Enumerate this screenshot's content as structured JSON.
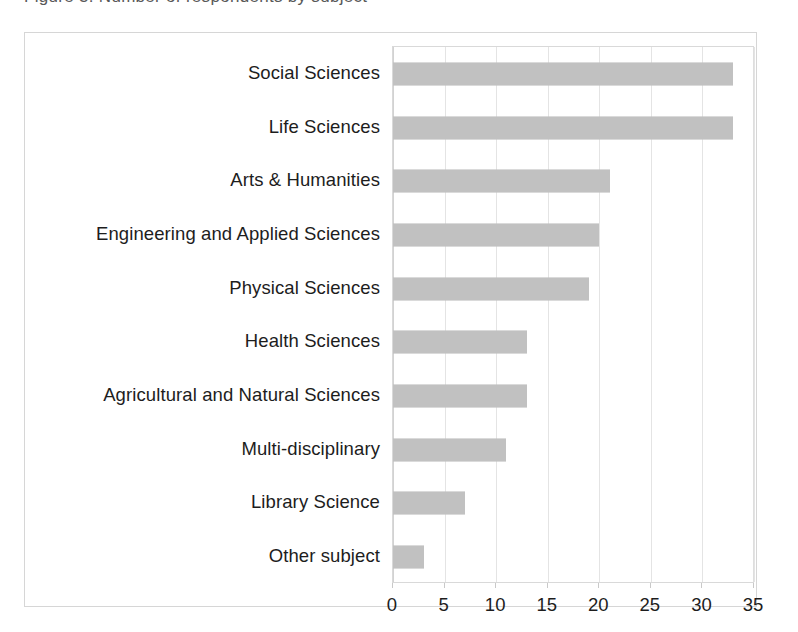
{
  "figure": {
    "title_remnant": "Figure 3. Number of respondents by subject",
    "background_color": "#ffffff",
    "frame_color": "#d6d6d6",
    "bar_color": "#aaaaaa",
    "gridline_color": "#e4e4e4",
    "text_color": "#1d1d1d"
  },
  "chart_data": {
    "type": "bar",
    "orientation": "horizontal",
    "title": "",
    "xlabel": "",
    "ylabel": "",
    "xlim": [
      0,
      35
    ],
    "xticks": [
      "0",
      "5",
      "10",
      "15",
      "20",
      "25",
      "30",
      "35"
    ],
    "xtick_values": [
      0,
      5,
      10,
      15,
      20,
      25,
      30,
      35
    ],
    "grid": "vertical",
    "legend": "none",
    "categories": [
      "Social Sciences",
      "Life Sciences",
      "Arts & Humanities",
      "Engineering and Applied Sciences",
      "Physical Sciences",
      "Health Sciences",
      "Agricultural and Natural Sciences",
      "Multi-disciplinary",
      "Library Science",
      "Other subject"
    ],
    "values": [
      33,
      33,
      21,
      20,
      19,
      13,
      13,
      11,
      7,
      3
    ],
    "bars": [
      {
        "label": "Social Sciences",
        "value": 33
      },
      {
        "label": "Life Sciences",
        "value": 33
      },
      {
        "label": "Arts & Humanities",
        "value": 21
      },
      {
        "label": "Engineering and Applied Sciences",
        "value": 20
      },
      {
        "label": "Physical Sciences",
        "value": 19
      },
      {
        "label": "Health Sciences",
        "value": 13
      },
      {
        "label": "Agricultural and Natural Sciences",
        "value": 13
      },
      {
        "label": "Multi-disciplinary",
        "value": 11
      },
      {
        "label": "Library Science",
        "value": 7
      },
      {
        "label": "Other subject",
        "value": 3
      }
    ]
  }
}
